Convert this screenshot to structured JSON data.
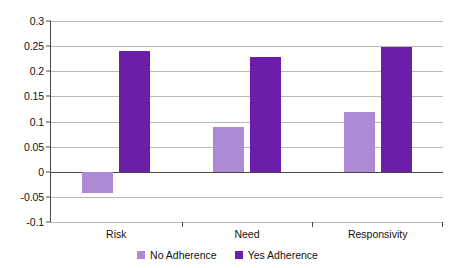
{
  "chart_data": {
    "type": "bar",
    "title": "",
    "subtitle": "",
    "xlabel": "",
    "ylabel": "",
    "categories": [
      "Risk",
      "Need",
      "Responsivity"
    ],
    "series": [
      {
        "name": "No Adherence",
        "color": "#ae8ad6",
        "values": [
          -0.042,
          0.089,
          0.118
        ]
      },
      {
        "name": "Yes Adherence",
        "color": "#6b1fa8",
        "values": [
          0.24,
          0.229,
          0.248
        ]
      }
    ],
    "ylim": [
      -0.1,
      0.3
    ],
    "ytick_labels": [
      "0.3",
      "0.25",
      "0.2",
      "0.15",
      "0.1",
      "0.05",
      "0",
      "-0.05",
      "-0.1"
    ],
    "ytick_values": [
      0.3,
      0.25,
      0.2,
      0.15,
      0.1,
      0.05,
      0,
      -0.05,
      -0.1
    ],
    "grid": true,
    "grid_axis": "y",
    "legend_position": "bottom",
    "zero_line": 0
  }
}
